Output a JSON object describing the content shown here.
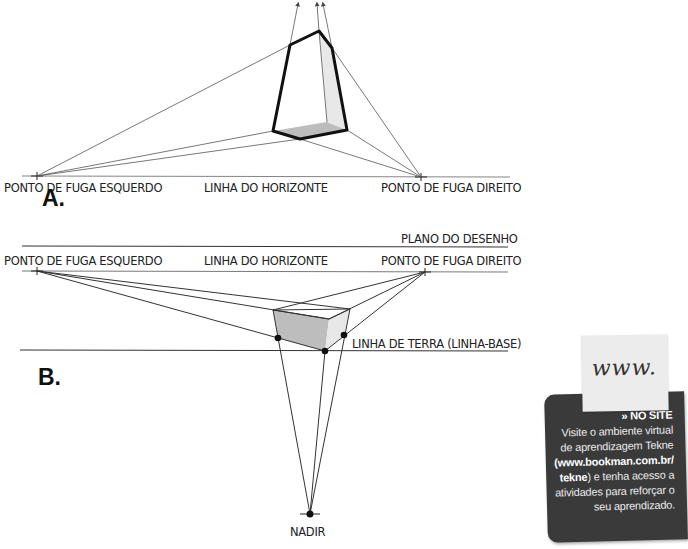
{
  "figure_a": {
    "letter": "A.",
    "labels": {
      "left_vp": "PONTO DE FUGA ESQUERDO",
      "horizon": "LINHA DO HORIZONTE",
      "right_vp": "PONTO DE FUGA DIREITO"
    }
  },
  "figure_b": {
    "letter": "B.",
    "labels": {
      "picture_plane": "PLANO DO DESENHO",
      "left_vp": "PONTO DE FUGA ESQUERDO",
      "horizon": "LINHA DO HORIZONTE",
      "right_vp": "PONTO DE FUGA DIREITO",
      "ground_line": "LINHA DE TERRA (LINHA-BASE)",
      "nadir": "NADIR"
    }
  },
  "sidebar": {
    "note_text": "www.",
    "heading": "» NO SITE",
    "line1": "Visite o ambiente virtual",
    "line2": "de aprendizagem Tekne",
    "url_part1": "(www.bookman.com.br/",
    "url_part2": "tekne",
    "line4_rest": ") e tenha acesso a",
    "line5": "atividades para reforçar o",
    "line6": "seu aprendizado."
  },
  "colors": {
    "line": "#555555",
    "box_edge": "#111111",
    "face_dark": "#bdbdbd",
    "face_light": "#e6e6e6",
    "card_bg": "#3a3a3a"
  }
}
